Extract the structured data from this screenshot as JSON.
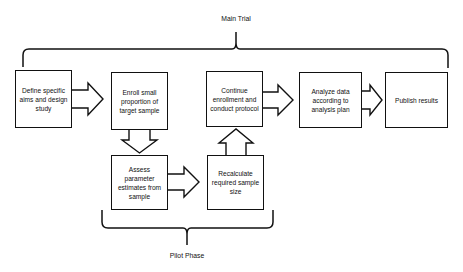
{
  "diagram": {
    "type": "flowchart",
    "groups": {
      "main_trial": {
        "label": "Main Trial"
      },
      "pilot_phase": {
        "label": "Pilot Phase"
      }
    },
    "nodes": [
      {
        "id": "define",
        "label": "Define specific aims and design study"
      },
      {
        "id": "enroll",
        "label": "Enroll small proportion of target sample"
      },
      {
        "id": "continue",
        "label": "Continue enrollment and conduct protocol"
      },
      {
        "id": "analyze",
        "label": "Analyze data according to analysis plan"
      },
      {
        "id": "publish",
        "label": "Publish results"
      },
      {
        "id": "assess",
        "label": "Assess parameter estimates from sample"
      },
      {
        "id": "recalc",
        "label": "Recalculate required sample size"
      }
    ],
    "edges": [
      {
        "from": "define",
        "to": "enroll",
        "style": "block-arrow-right"
      },
      {
        "from": "enroll",
        "to": "assess",
        "style": "block-arrow-down"
      },
      {
        "from": "assess",
        "to": "recalc",
        "style": "block-arrow-right"
      },
      {
        "from": "recalc",
        "to": "continue",
        "style": "block-arrow-up"
      },
      {
        "from": "continue",
        "to": "analyze",
        "style": "block-arrow-right"
      },
      {
        "from": "analyze",
        "to": "publish",
        "style": "block-arrow-right"
      }
    ]
  }
}
